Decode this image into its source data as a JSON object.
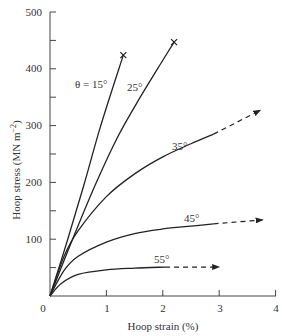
{
  "chart_data": {
    "type": "line",
    "title": "",
    "xlabel": "Hoop strain (%)",
    "ylabel": "Hoop stress (MN m⁻²)",
    "xlim": [
      0,
      4
    ],
    "ylim": [
      0,
      500
    ],
    "xticks": [
      0,
      1,
      2,
      3,
      4
    ],
    "yticks": [
      0,
      100,
      200,
      300,
      400,
      500
    ],
    "yminor_ticks": [
      50,
      150,
      250,
      350,
      450
    ],
    "grid": false,
    "legend": "inline labels",
    "series": [
      {
        "name": "θ = 15°",
        "label": "θ = 15°",
        "end_marker": "cross (failure)",
        "points": [
          [
            0,
            0
          ],
          [
            0.3,
            95
          ],
          [
            0.6,
            195
          ],
          [
            0.9,
            300
          ],
          [
            1.3,
            424
          ]
        ],
        "extrapolated": []
      },
      {
        "name": "25°",
        "label": "25°",
        "end_marker": "cross (failure)",
        "points": [
          [
            0,
            0
          ],
          [
            0.4,
            100
          ],
          [
            0.8,
            195
          ],
          [
            1.2,
            280
          ],
          [
            1.6,
            350
          ],
          [
            2.0,
            415
          ],
          [
            2.2,
            447
          ]
        ],
        "extrapolated": []
      },
      {
        "name": "35°",
        "label": "35°",
        "end_marker": "arrow (extrapolated)",
        "points": [
          [
            0,
            0
          ],
          [
            0.25,
            70
          ],
          [
            0.5,
            115
          ],
          [
            1.0,
            175
          ],
          [
            1.5,
            215
          ],
          [
            2.0,
            245
          ],
          [
            2.5,
            268
          ],
          [
            2.9,
            285
          ]
        ],
        "extrapolated": [
          [
            2.9,
            285
          ],
          [
            3.73,
            327
          ]
        ]
      },
      {
        "name": "45°",
        "label": "45°",
        "end_marker": "arrow (extrapolated)",
        "points": [
          [
            0,
            0
          ],
          [
            0.25,
            45
          ],
          [
            0.5,
            70
          ],
          [
            1.0,
            95
          ],
          [
            1.5,
            110
          ],
          [
            2.0,
            118
          ],
          [
            2.5,
            123
          ],
          [
            2.9,
            127
          ]
        ],
        "extrapolated": [
          [
            2.9,
            127
          ],
          [
            3.77,
            134
          ]
        ]
      },
      {
        "name": "55°",
        "label": "55°",
        "end_marker": "arrow (extrapolated)",
        "points": [
          [
            0,
            0
          ],
          [
            0.2,
            22
          ],
          [
            0.5,
            38
          ],
          [
            1.0,
            46
          ],
          [
            1.5,
            49
          ],
          [
            2.04,
            51
          ]
        ],
        "extrapolated": [
          [
            2.04,
            51
          ],
          [
            3.0,
            51
          ]
        ]
      }
    ]
  },
  "axes": {
    "x_label": "Hoop strain (%)",
    "y_label": "Hoop stress (MN m",
    "y_label_sup": "−2",
    "y_label_close": ")",
    "x_ticks": [
      "0",
      "1",
      "2",
      "3",
      "4"
    ],
    "y_ticks": [
      "100",
      "200",
      "300",
      "400",
      "500"
    ]
  },
  "labels": {
    "s15": "θ = 15°",
    "s25": "25°",
    "s35": "35°",
    "s45": "45°",
    "s55": "55°"
  }
}
